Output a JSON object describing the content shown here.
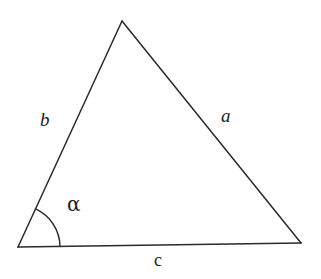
{
  "figure": {
    "background_color": "#ffffff",
    "stroke_color": "#2a2a2a",
    "stroke_width": 1.5,
    "width": 321,
    "height": 279
  },
  "triangle": {
    "vertices": {
      "apex": {
        "x": 122,
        "y": 21
      },
      "bottom_left": {
        "x": 18,
        "y": 247
      },
      "bottom_right": {
        "x": 301,
        "y": 243
      }
    },
    "sides": [
      {
        "id": "a",
        "label": "a",
        "from": "apex",
        "to": "bottom_right",
        "style": "italic"
      },
      {
        "id": "b",
        "label": "b",
        "from": "bottom_left",
        "to": "apex",
        "style": "italic"
      },
      {
        "id": "c",
        "label": "c",
        "from": "bottom_left",
        "to": "bottom_right",
        "style": "upright"
      }
    ]
  },
  "angle_marker": {
    "label": "α",
    "symbol_name": "greek-small-letter-alpha",
    "at_vertex": "bottom_left",
    "radius": 42,
    "arc_start": {
      "x": 37,
      "y": 205
    },
    "arc_end": {
      "x": 60,
      "y": 246
    },
    "label_position": {
      "x": 76,
      "y": 207
    }
  },
  "labels": {
    "side_a": "a",
    "side_b": "b",
    "side_c": "c",
    "angle_alpha": "α"
  }
}
